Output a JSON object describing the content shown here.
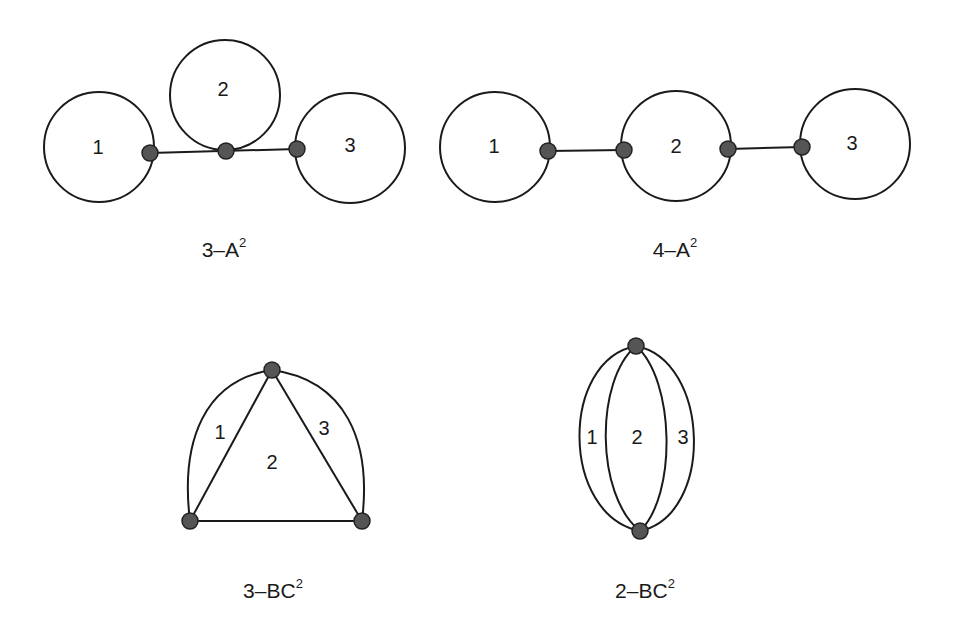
{
  "figure": {
    "colors": {
      "stroke": "#1a1a1a",
      "node_fill": "#555555",
      "background": "#ffffff"
    },
    "diagrams": [
      {
        "id": "3-A2",
        "caption_main": "3–A",
        "caption_sup": "2",
        "face_labels": [
          "1",
          "2",
          "3"
        ],
        "description": "Three circular loops: loops 1 and 3 joined by a horizontal edge, loop 2 tangent at a vertex on the middle of that edge"
      },
      {
        "id": "4-A2",
        "caption_main": "4–A",
        "caption_sup": "2",
        "face_labels": [
          "1",
          "2",
          "3"
        ],
        "description": "Three circles in a chain, connected by two straight edges; four vertices"
      },
      {
        "id": "3-BC2",
        "caption_main": "3–BC",
        "caption_sup": "2",
        "face_labels": [
          "1",
          "2",
          "3"
        ],
        "description": "Triangle with curved outer arcs on the two upper sides; three vertices"
      },
      {
        "id": "2-BC2",
        "caption_main": "2–BC",
        "caption_sup": "2",
        "face_labels": [
          "1",
          "2",
          "3"
        ],
        "description": "Four arcs joining two vertices (top and bottom), forming three faces"
      }
    ]
  }
}
